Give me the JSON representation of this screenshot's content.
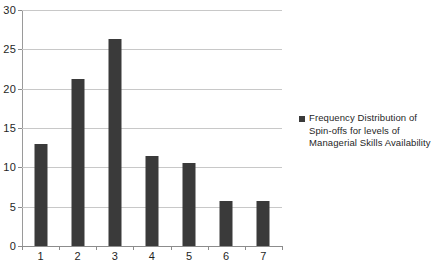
{
  "chart_data": {
    "type": "bar",
    "title": "",
    "xlabel": "",
    "ylabel": "",
    "categories": [
      "1",
      "2",
      "3",
      "4",
      "5",
      "6",
      "7"
    ],
    "values": [
      13.0,
      21.2,
      26.3,
      11.5,
      10.5,
      5.7,
      5.7
    ],
    "series": [
      {
        "name": "Frequency Distribution of Spin-offs for levels of Managerial Skills Availability",
        "values": [
          13.0,
          21.2,
          26.3,
          11.5,
          10.5,
          5.7,
          5.7
        ],
        "color": "#3a3a3a"
      }
    ],
    "ylim": [
      0,
      30
    ],
    "ytick_labels": [
      "0",
      "5",
      "10",
      "15",
      "20",
      "25",
      "30"
    ],
    "ytick_values": [
      0,
      5,
      10,
      15,
      20,
      25,
      30
    ],
    "xtick_labels": [
      "1",
      "2",
      "3",
      "4",
      "5",
      "6",
      "7"
    ],
    "grid": true,
    "grid_axis": "y",
    "legend_position": "right",
    "legend_entries": [
      {
        "label": "Frequency Distribution of Spin-offs for levels of Managerial Skills Availability",
        "color": "#3a3a3a",
        "marker": "square"
      }
    ],
    "colors": {
      "bar": "#3a3a3a",
      "gridline": "#c8c8c8",
      "axis": "#8c8c8c",
      "background": "#ffffff",
      "text": "#1f1f1f"
    }
  }
}
